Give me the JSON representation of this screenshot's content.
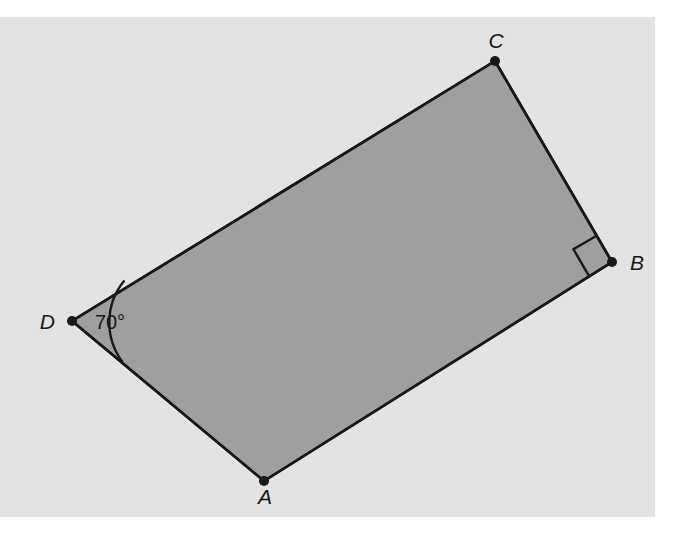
{
  "figure": {
    "kind": "geometry-diagram",
    "shape_name": "quadrilateral-ABCD",
    "canvas": {
      "width": 688,
      "height": 542
    },
    "colors": {
      "page_background": "#fdfdfd",
      "panel_background": "#e3e3e3",
      "shape_fill": "#9f9f9f",
      "stroke": "#16181a",
      "label_color": "#16181a"
    },
    "panel": {
      "x": 0,
      "y": 17,
      "width": 655,
      "height": 500
    },
    "stroke_width": 2.6,
    "vertices": [
      {
        "id": "A",
        "label": "A",
        "x": 264,
        "y": 481,
        "label_x": 265,
        "label_y": 504,
        "dot_radius": 5
      },
      {
        "id": "B",
        "label": "B",
        "x": 612,
        "y": 262,
        "label_x": 630,
        "label_y": 270,
        "dot_radius": 5
      },
      {
        "id": "C",
        "label": "C",
        "x": 495,
        "y": 61,
        "label_x": 496,
        "label_y": 48,
        "dot_radius": 5
      },
      {
        "id": "D",
        "label": "D",
        "x": 72,
        "y": 321,
        "label_x": 55,
        "label_y": 329,
        "dot_radius": 5
      }
    ],
    "edges": [
      {
        "id": "DC",
        "from": "D",
        "to": "C"
      },
      {
        "id": "CB",
        "from": "C",
        "to": "B"
      },
      {
        "id": "BA",
        "from": "B",
        "to": "A"
      },
      {
        "id": "AD",
        "from": "A",
        "to": "D"
      }
    ],
    "angle_marks": [
      {
        "id": "angle-D",
        "at_vertex": "D",
        "type": "arc",
        "value": "70°",
        "measure_degrees": 70,
        "arc_radius": 66,
        "label_x": 110,
        "label_y": 329
      },
      {
        "id": "angle-B",
        "at_vertex": "B",
        "type": "right-angle-square",
        "value": "90°",
        "measure_degrees": 90,
        "square_size": 27
      }
    ]
  }
}
